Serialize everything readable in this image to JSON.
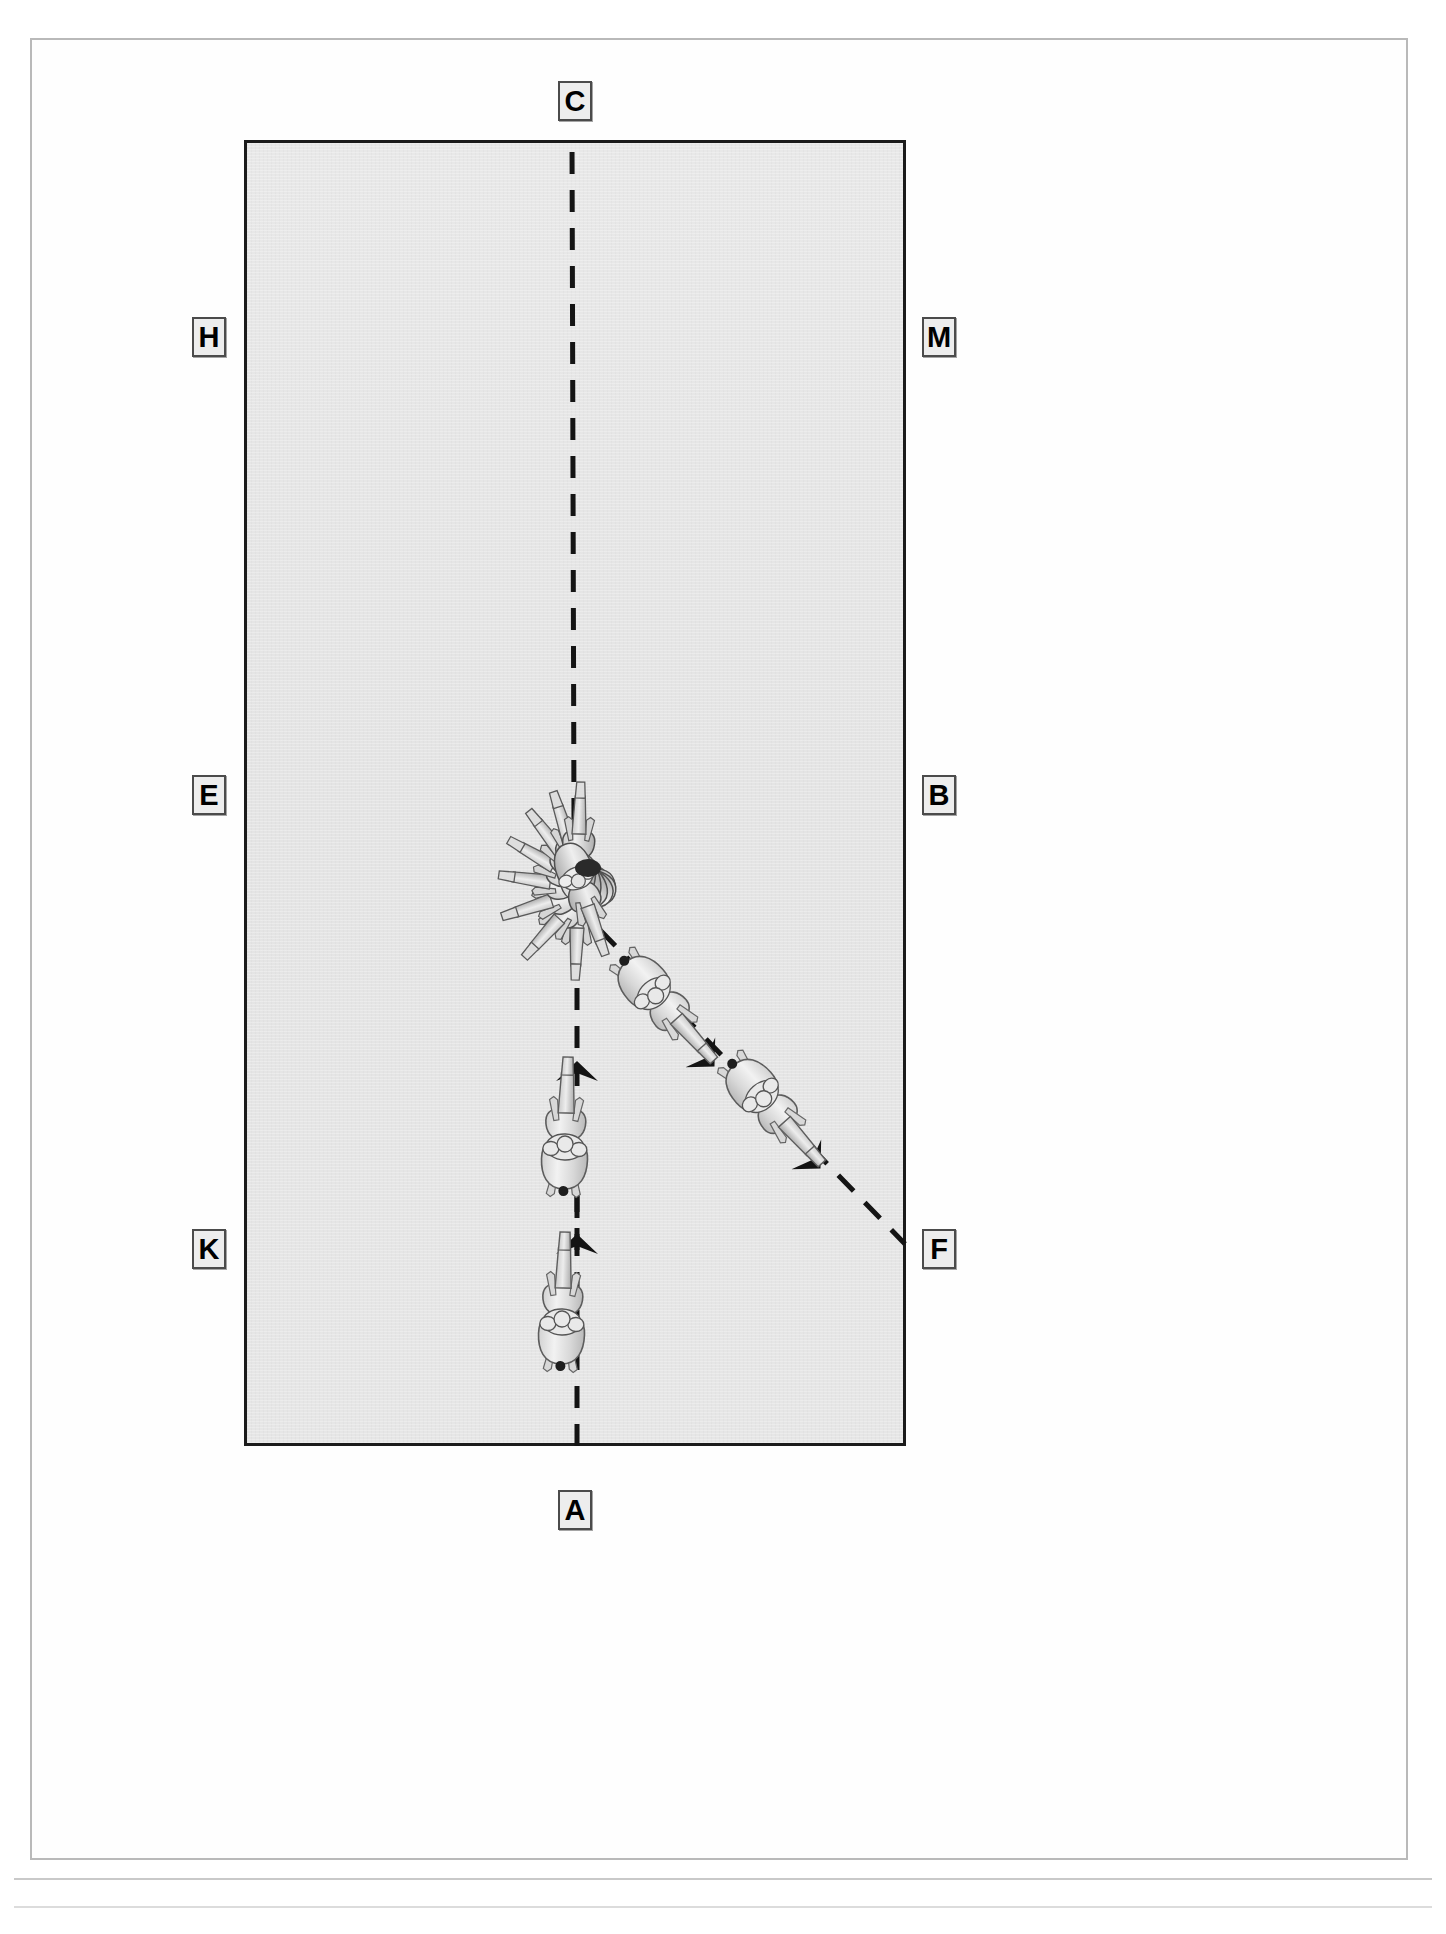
{
  "diagram": {
    "type": "dressage-arena-test-diagram",
    "arena": {
      "label": "dressage arena",
      "orientation": "portrait",
      "fill_color": "#e6e6e6",
      "border_color": "#1b1b1b"
    },
    "letters": [
      {
        "id": "C",
        "label": "C",
        "side": "top",
        "x": 558,
        "y": 81
      },
      {
        "id": "H",
        "label": "H",
        "side": "left",
        "x": 192,
        "y": 317
      },
      {
        "id": "M",
        "label": "M",
        "side": "right",
        "x": 922,
        "y": 317
      },
      {
        "id": "E",
        "label": "E",
        "side": "left",
        "x": 192,
        "y": 775
      },
      {
        "id": "B",
        "label": "B",
        "side": "right",
        "x": 922,
        "y": 775
      },
      {
        "id": "K",
        "label": "K",
        "side": "left",
        "x": 192,
        "y": 1229
      },
      {
        "id": "F",
        "label": "F",
        "side": "right",
        "x": 922,
        "y": 1229
      },
      {
        "id": "A",
        "label": "A",
        "side": "bottom",
        "x": 558,
        "y": 1490
      }
    ],
    "paths": [
      {
        "id": "centerline",
        "name": "center-line-a-to-x",
        "style": "dashed",
        "from": "A",
        "to": "C",
        "description": "dashed centre line running from A at the bottom up through X to C at the top"
      },
      {
        "id": "diagonal-to-f",
        "name": "diagonal-x-to-f",
        "style": "dashed",
        "from": "X",
        "to": "F",
        "description": "dashed diagonal leaving the turn point heading down-right to F"
      }
    ],
    "movement_arrows": [
      {
        "id": "arrow-1",
        "direction": "up",
        "x": 577,
        "y": 1246
      },
      {
        "id": "arrow-2",
        "direction": "up",
        "x": 577,
        "y": 1073
      },
      {
        "id": "arrow-3",
        "direction": "down-right",
        "x": 703,
        "y": 1055
      },
      {
        "id": "arrow-4",
        "direction": "down-right",
        "x": 810,
        "y": 1157
      }
    ],
    "horses": [
      {
        "id": "horse-1",
        "name": "horse-on-centerline-lower",
        "x": 560,
        "y": 1310,
        "rotation": 0,
        "caption": "horse and rider tracking up the centre line"
      },
      {
        "id": "horse-2",
        "name": "horse-on-centerline-upper",
        "x": 562,
        "y": 1140,
        "rotation": 0,
        "caption": "horse and rider approaching the turn"
      },
      {
        "id": "horse-3",
        "name": "horse-on-diagonal-upper",
        "x": 658,
        "y": 990,
        "rotation": 135,
        "caption": "horse and rider leaving on the diagonal"
      },
      {
        "id": "horse-4",
        "name": "horse-on-diagonal-lower",
        "x": 765,
        "y": 1092,
        "rotation": 135,
        "caption": "horse and rider continuing to F"
      }
    ],
    "pirouette": {
      "id": "pirouette-figure",
      "name": "pirouette-turn-on-the-haunches",
      "center_x": 576,
      "center_y": 856,
      "positions": 9,
      "description": "multiple superimposed horse outlines fanned around a single pivot point showing a full pirouette / turn about the haunches"
    }
  }
}
